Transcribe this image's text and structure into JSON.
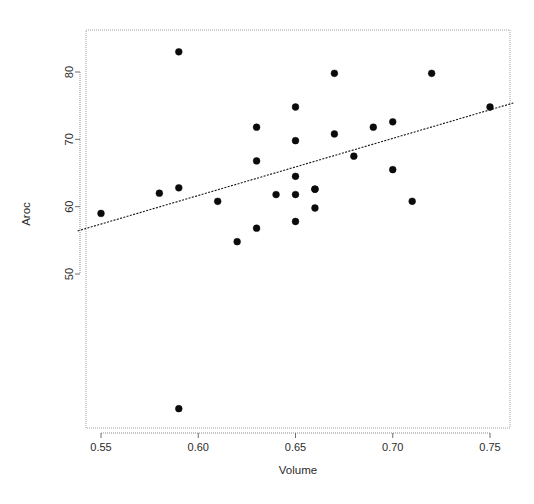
{
  "chart_data": {
    "type": "scatter",
    "title": "",
    "xlabel": "Volume",
    "ylabel": "Aroc",
    "xlim": [
      0.538,
      0.762
    ],
    "ylim": [
      26,
      86
    ],
    "xticks": [
      0.55,
      0.6,
      0.65,
      0.7,
      0.75
    ],
    "xtick_labels": [
      "0.55",
      "0.60",
      "0.65",
      "0.70",
      "0.75"
    ],
    "yticks": [
      50,
      60,
      70,
      80
    ],
    "ytick_labels": [
      "50",
      "60",
      "70",
      "80"
    ],
    "grid": false,
    "legend": null,
    "point_color": "#0b0b0b",
    "line_color": "#141414",
    "series": [
      {
        "name": "observations",
        "marker": "filled-circle",
        "x": [
          0.55,
          0.58,
          0.59,
          0.59,
          0.59,
          0.61,
          0.62,
          0.63,
          0.63,
          0.63,
          0.64,
          0.65,
          0.65,
          0.65,
          0.65,
          0.65,
          0.66,
          0.66,
          0.66,
          0.67,
          0.67,
          0.68,
          0.69,
          0.7,
          0.7,
          0.71,
          0.72,
          0.75
        ],
        "y": [
          59.0,
          62.0,
          62.8,
          83.0,
          30.0,
          60.8,
          54.8,
          71.8,
          66.8,
          56.8,
          61.8,
          74.8,
          69.8,
          64.5,
          61.8,
          57.8,
          62.6,
          59.8,
          62.6,
          79.8,
          70.8,
          67.5,
          71.8,
          72.6,
          65.5,
          60.8,
          79.8,
          74.8
        ]
      }
    ],
    "fit_line": {
      "name": "least-squares fit",
      "style": "dotted",
      "x": [
        0.538,
        0.762
      ],
      "y": [
        56.4,
        75.4
      ]
    }
  }
}
